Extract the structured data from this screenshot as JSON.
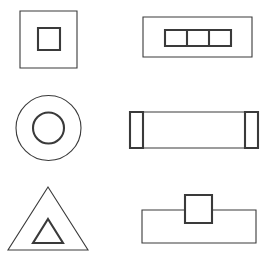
{
  "figure": {
    "background_color": "#ffffff",
    "stroke_color": "#3a3a3a",
    "canvas": {
      "width": 274,
      "height": 269
    },
    "grid": {
      "columns": 2,
      "rows": 3,
      "count": 6
    }
  },
  "shapes": [
    {
      "id": "square-in-square",
      "position": "top-left",
      "label": "Small square centered inside a large square",
      "outer": {
        "kind": "square",
        "x": 20,
        "y": 11,
        "width": 57,
        "height": 57,
        "stroke_width": 1.1
      },
      "inner": {
        "kind": "square",
        "x": 38,
        "y": 28,
        "width": 22,
        "height": 22,
        "stroke_width": 2.1
      }
    },
    {
      "id": "segmented-bar-in-rectangle",
      "position": "top-right",
      "label": "Three-cell segmented bar inside a wide rectangle",
      "outer": {
        "kind": "rectangle",
        "x": 143,
        "y": 17,
        "width": 109,
        "height": 40,
        "stroke_width": 1.1
      },
      "inner": {
        "kind": "rectangle",
        "x": 165,
        "y": 30,
        "width": 66,
        "height": 16,
        "stroke_width": 2.1,
        "segments": 3,
        "divider_x": [
          187,
          209
        ]
      }
    },
    {
      "id": "circle-in-circle",
      "position": "middle-left",
      "label": "Concentric circles, small circle inside large circle",
      "outer": {
        "kind": "circle",
        "cx": 48.5,
        "cy": 128,
        "r": 32.5,
        "stroke_width": 1.1
      },
      "inner": {
        "kind": "circle",
        "cx": 48.5,
        "cy": 128,
        "r": 15.5,
        "stroke_width": 2.1
      }
    },
    {
      "id": "capped-bar",
      "position": "middle-right",
      "label": "Horizontal bar with vertical end caps near both ends",
      "outer": {
        "kind": "rectangle",
        "x": 130,
        "y": 112,
        "width": 128,
        "height": 36,
        "stroke_width": 1.1
      },
      "inner": {
        "kind": "end-caps",
        "stroke_width": 2.1,
        "cap_left_x": 143,
        "cap_right_x": 245,
        "cap_top_y": 112,
        "cap_bottom_y": 148,
        "cap_outer_left_x": 130,
        "cap_outer_right_x": 258
      }
    },
    {
      "id": "triangle-in-triangle",
      "position": "bottom-left",
      "label": "Small triangle nested inside a large triangle",
      "outer": {
        "kind": "triangle",
        "points": "48,187 88,250 8,250",
        "stroke_width": 1.1
      },
      "inner": {
        "kind": "triangle",
        "points": "48,219 63,243 33,243",
        "stroke_width": 2.1
      }
    },
    {
      "id": "square-on-rectangle",
      "position": "bottom-right",
      "label": "Square straddling the top edge of a wide rectangle",
      "outer": {
        "kind": "rectangle",
        "x": 142,
        "y": 210,
        "width": 114,
        "height": 33,
        "stroke_width": 1.1
      },
      "inner": {
        "kind": "square",
        "x": 185,
        "y": 195,
        "width": 27,
        "height": 28,
        "stroke_width": 2.1,
        "overlap": "protrudes-above-top-edge"
      }
    }
  ]
}
